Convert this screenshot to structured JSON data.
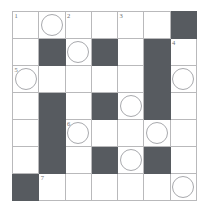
{
  "puzzle": {
    "type": "crossword-grid",
    "rows": 7,
    "cols": 7,
    "colors": {
      "block": "#575b60",
      "open": "#ffffff",
      "grid_line": "#b9b9bb",
      "number_text": "#6d6f72",
      "circle_outline": "#a8a9ad"
    },
    "clue_numbers_visible": [
      "1",
      "2",
      "3",
      "4",
      "5",
      "6",
      "7"
    ],
    "circle_count": 10,
    "block_count": 16,
    "cells": [
      [
        {
          "block": false,
          "number": "1",
          "circle": false,
          "letter": ""
        },
        {
          "block": false,
          "number": "",
          "circle": true,
          "letter": ""
        },
        {
          "block": false,
          "number": "2",
          "circle": false,
          "letter": ""
        },
        {
          "block": false,
          "number": "",
          "circle": false,
          "letter": ""
        },
        {
          "block": false,
          "number": "3",
          "circle": false,
          "letter": ""
        },
        {
          "block": false,
          "number": "",
          "circle": false,
          "letter": ""
        },
        {
          "block": true,
          "number": "",
          "circle": false,
          "letter": ""
        }
      ],
      [
        {
          "block": false,
          "number": "",
          "circle": false,
          "letter": ""
        },
        {
          "block": true,
          "number": "",
          "circle": false,
          "letter": ""
        },
        {
          "block": false,
          "number": "",
          "circle": true,
          "letter": ""
        },
        {
          "block": true,
          "number": "",
          "circle": false,
          "letter": ""
        },
        {
          "block": false,
          "number": "",
          "circle": false,
          "letter": ""
        },
        {
          "block": true,
          "number": "",
          "circle": false,
          "letter": ""
        },
        {
          "block": false,
          "number": "4",
          "circle": false,
          "letter": ""
        }
      ],
      [
        {
          "block": false,
          "number": "5",
          "circle": true,
          "letter": ""
        },
        {
          "block": false,
          "number": "",
          "circle": false,
          "letter": ""
        },
        {
          "block": false,
          "number": "",
          "circle": false,
          "letter": ""
        },
        {
          "block": false,
          "number": "",
          "circle": false,
          "letter": ""
        },
        {
          "block": false,
          "number": "",
          "circle": false,
          "letter": ""
        },
        {
          "block": true,
          "number": "",
          "circle": false,
          "letter": ""
        },
        {
          "block": false,
          "number": "",
          "circle": true,
          "letter": ""
        }
      ],
      [
        {
          "block": false,
          "number": "",
          "circle": false,
          "letter": ""
        },
        {
          "block": true,
          "number": "",
          "circle": false,
          "letter": ""
        },
        {
          "block": false,
          "number": "",
          "circle": false,
          "letter": ""
        },
        {
          "block": true,
          "number": "",
          "circle": false,
          "letter": ""
        },
        {
          "block": false,
          "number": "",
          "circle": true,
          "letter": ""
        },
        {
          "block": true,
          "number": "",
          "circle": false,
          "letter": ""
        },
        {
          "block": false,
          "number": "",
          "circle": false,
          "letter": ""
        }
      ],
      [
        {
          "block": false,
          "number": "",
          "circle": false,
          "letter": ""
        },
        {
          "block": true,
          "number": "",
          "circle": false,
          "letter": ""
        },
        {
          "block": false,
          "number": "6",
          "circle": true,
          "letter": ""
        },
        {
          "block": false,
          "number": "",
          "circle": false,
          "letter": ""
        },
        {
          "block": false,
          "number": "",
          "circle": false,
          "letter": ""
        },
        {
          "block": false,
          "number": "",
          "circle": true,
          "letter": ""
        },
        {
          "block": false,
          "number": "",
          "circle": false,
          "letter": ""
        }
      ],
      [
        {
          "block": false,
          "number": "",
          "circle": false,
          "letter": ""
        },
        {
          "block": true,
          "number": "",
          "circle": false,
          "letter": ""
        },
        {
          "block": false,
          "number": "",
          "circle": false,
          "letter": ""
        },
        {
          "block": true,
          "number": "",
          "circle": false,
          "letter": ""
        },
        {
          "block": false,
          "number": "",
          "circle": true,
          "letter": ""
        },
        {
          "block": true,
          "number": "",
          "circle": false,
          "letter": ""
        },
        {
          "block": false,
          "number": "",
          "circle": false,
          "letter": ""
        }
      ],
      [
        {
          "block": true,
          "number": "",
          "circle": false,
          "letter": ""
        },
        {
          "block": false,
          "number": "7",
          "circle": false,
          "letter": ""
        },
        {
          "block": false,
          "number": "",
          "circle": false,
          "letter": ""
        },
        {
          "block": false,
          "number": "",
          "circle": false,
          "letter": ""
        },
        {
          "block": false,
          "number": "",
          "circle": false,
          "letter": ""
        },
        {
          "block": false,
          "number": "",
          "circle": false,
          "letter": ""
        },
        {
          "block": false,
          "number": "",
          "circle": true,
          "letter": ""
        }
      ]
    ]
  }
}
